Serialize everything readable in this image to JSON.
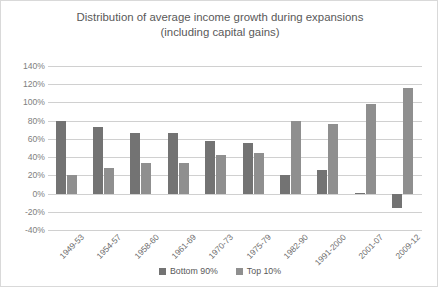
{
  "chart_data": {
    "type": "bar",
    "title": "Distribution of average income growth during expansions\n(including capital gains)",
    "xlabel": "",
    "ylabel": "",
    "ylim": [
      -40,
      140
    ],
    "ytick_step": 20,
    "ytick_labels": [
      "140%",
      "120%",
      "100%",
      "80%",
      "60%",
      "40%",
      "20%",
      "0%",
      "-20%",
      "-40%"
    ],
    "ytick_values": [
      140,
      120,
      100,
      80,
      60,
      40,
      20,
      0,
      -20,
      -40
    ],
    "grid": true,
    "legend_position": "bottom",
    "categories": [
      "1949-53",
      "1954-57",
      "1958-60",
      "1961-69",
      "1970-73",
      "1975-79",
      "1982-90",
      "1991-2000",
      "2001-07",
      "2009-12"
    ],
    "series": [
      {
        "name": "Bottom 90%",
        "color": "#737373",
        "values": [
          80,
          73,
          67,
          66,
          58,
          56,
          20,
          26,
          1,
          -16
        ]
      },
      {
        "name": "Top 10%",
        "color": "#8f8f8f",
        "values": [
          20,
          28,
          33,
          34,
          42,
          44,
          80,
          76,
          98,
          116
        ]
      }
    ]
  },
  "legend": {
    "items": [
      {
        "label": "Bottom 90%",
        "color": "#737373"
      },
      {
        "label": "Top 10%",
        "color": "#8f8f8f"
      }
    ]
  }
}
